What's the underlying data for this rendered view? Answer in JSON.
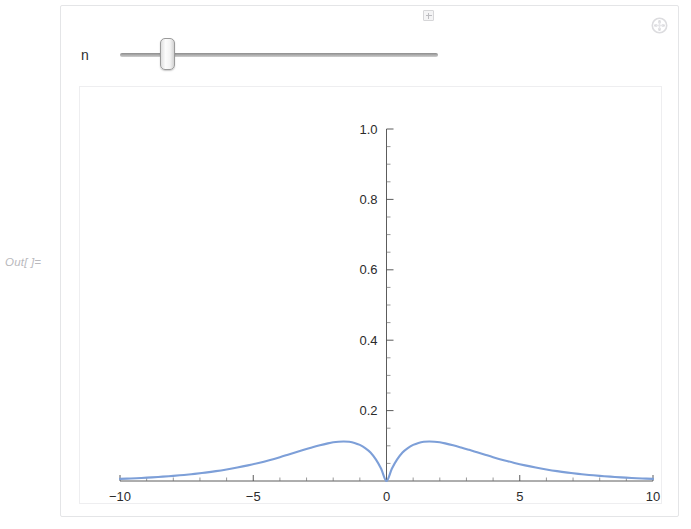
{
  "cell": {
    "out_label": "Out[ ]="
  },
  "manipulate": {
    "menu_icon": "plus-circle-icon",
    "controls": [
      {
        "label": "n",
        "type": "slider",
        "thumb_fraction": 0.148,
        "expand_icon": "plus-square-icon"
      }
    ]
  },
  "chart_data": {
    "type": "line",
    "title": "",
    "xlabel": "",
    "ylabel": "",
    "xlim": [
      -10,
      10
    ],
    "ylim": [
      0,
      1.0
    ],
    "grid": false,
    "legend": null,
    "x_ticks": [
      -10,
      -5,
      0,
      5,
      10
    ],
    "x_tick_labels": [
      "-10",
      "-5",
      "0",
      "5",
      "10"
    ],
    "x_minor_step": 1,
    "y_ticks": [
      0.2,
      0.4,
      0.6,
      0.8,
      1.0
    ],
    "y_tick_labels": [
      "0.2",
      "0.4",
      "0.6",
      "0.8",
      "1.0"
    ],
    "y_minor_step": 0.05,
    "line_color": "#7d9fd8",
    "peaks": [
      {
        "x": -2.0,
        "y": 0.125
      },
      {
        "x": 2.0,
        "y": 0.125
      }
    ],
    "minimum": {
      "x": 0.0,
      "y": 0.0
    },
    "series": [
      {
        "name": "curve",
        "x": [
          -10,
          -9.6,
          -9.2,
          -8.8,
          -8.4,
          -8,
          -7.6,
          -7.2,
          -6.8,
          -6.4,
          -6,
          -5.6,
          -5.2,
          -4.8,
          -4.4,
          -4,
          -3.7,
          -3.4,
          -3.1,
          -2.8,
          -2.5,
          -2.2,
          -2,
          -1.8,
          -1.6,
          -1.4,
          -1.2,
          -1,
          -0.8,
          -0.6,
          -0.4,
          -0.2,
          0,
          0.2,
          0.4,
          0.6,
          0.8,
          1,
          1.2,
          1.4,
          1.6,
          1.8,
          2,
          2.2,
          2.5,
          2.8,
          3.1,
          3.4,
          3.7,
          4,
          4.4,
          4.8,
          5.2,
          5.6,
          6,
          6.4,
          6.8,
          7.2,
          7.6,
          8,
          8.4,
          8.8,
          9.2,
          9.6,
          10
        ],
        "y": [
          0.0061,
          0.0073,
          0.0087,
          0.0104,
          0.0123,
          0.0146,
          0.0172,
          0.0203,
          0.0239,
          0.028,
          0.0328,
          0.0382,
          0.0444,
          0.0514,
          0.0592,
          0.0677,
          0.0746,
          0.0816,
          0.0885,
          0.0952,
          0.1015,
          0.1069,
          0.1099,
          0.1117,
          0.1123,
          0.1113,
          0.1082,
          0.1025,
          0.0937,
          0.0812,
          0.0614,
          0.0348,
          0.0,
          0.0348,
          0.0614,
          0.0812,
          0.0937,
          0.1025,
          0.1082,
          0.1113,
          0.1123,
          0.1117,
          0.1099,
          0.1069,
          0.1015,
          0.0952,
          0.0885,
          0.0816,
          0.0746,
          0.0677,
          0.0592,
          0.0514,
          0.0444,
          0.0382,
          0.0328,
          0.028,
          0.0239,
          0.0203,
          0.0172,
          0.0146,
          0.0123,
          0.0104,
          0.0087,
          0.0073,
          0.0061
        ]
      }
    ]
  }
}
